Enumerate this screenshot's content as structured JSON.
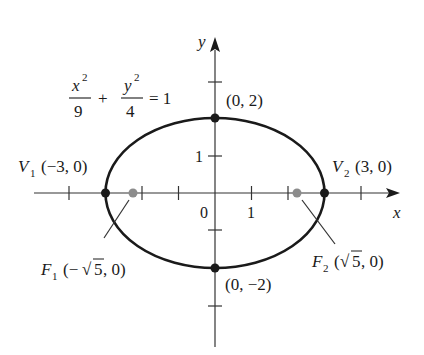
{
  "figure": {
    "type": "ellipse-diagram",
    "equation": {
      "x_num": "x",
      "x_exp": "2",
      "x_den": "9",
      "plus": "+",
      "y_num": "y",
      "y_exp": "2",
      "y_den": "4",
      "equals": "= 1"
    },
    "axes": {
      "x_label": "x",
      "y_label": "y",
      "origin_label": "0",
      "x_tick_label": "1",
      "y_tick_label": "1",
      "x_ticks": [
        -4,
        -3,
        -2,
        -1,
        1,
        2,
        3,
        4
      ],
      "y_ticks": [
        -3,
        -2,
        -1,
        1,
        2,
        3
      ]
    },
    "ellipse": {
      "a": 3,
      "b": 2,
      "center": [
        0,
        0
      ]
    },
    "points": {
      "v1": {
        "name": "V",
        "sub": "1",
        "coords": "(−3, 0)",
        "x": -3,
        "y": 0
      },
      "v2": {
        "name": "V",
        "sub": "2",
        "coords": "(3, 0)",
        "x": 3,
        "y": 0
      },
      "top": {
        "coords": "(0, 2)",
        "x": 0,
        "y": 2
      },
      "bottom": {
        "coords": "(0, −2)",
        "x": 0,
        "y": -2
      },
      "f1": {
        "name": "F",
        "sub": "1",
        "open": "(−",
        "radical": "√",
        "radicand": "5",
        "close": ", 0)",
        "x": -2.236,
        "y": 0
      },
      "f2": {
        "name": "F",
        "sub": "2",
        "open": "(",
        "radical": "√",
        "radicand": "5",
        "close": ", 0)",
        "x": 2.236,
        "y": 0
      }
    },
    "colors": {
      "ink": "#1a1a1a",
      "focus": "#8c8c8c",
      "background": "#ffffff"
    }
  }
}
